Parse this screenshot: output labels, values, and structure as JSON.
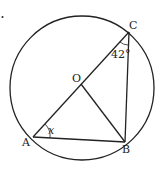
{
  "diagram": {
    "labels": {
      "A": "A",
      "B": "B",
      "C": "C",
      "O": "O",
      "angle_x": "x",
      "angle_c": "42°"
    },
    "colors": {
      "stroke": "#222222",
      "background": "#ffffff"
    }
  }
}
